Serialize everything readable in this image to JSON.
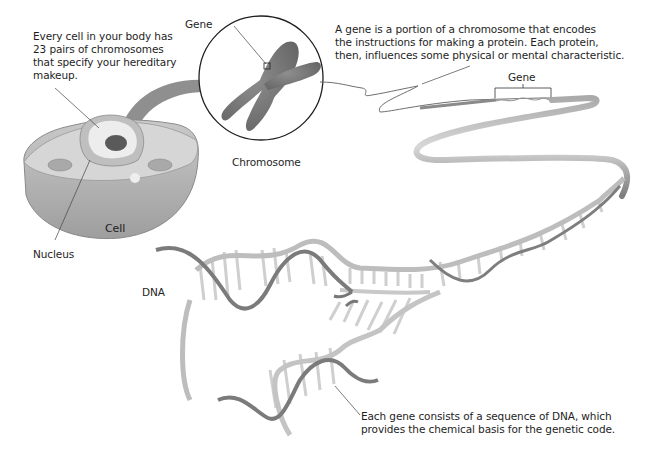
{
  "diagram": {
    "type": "biology-illustration",
    "colors": {
      "background": "#ffffff",
      "text": "#1e1e1e",
      "arrow": "#8a8a8a",
      "chromosome": "#7b7b7b",
      "cell_body": "#b9b9b9",
      "cell_top": "#d4d4d4",
      "nucleus": "#e6e6e6",
      "nucleolus": "#555555",
      "dna_backbone_dark": "#7a7a7a",
      "dna_backbone_light": "#bdbdbd",
      "dna_rungs": "#d0d0d0",
      "leader_line": "#444444"
    }
  },
  "labels": {
    "cell_description": "Every cell in your body has\n23 pairs of chromosomes\nthat specify your hereditary\nmakeup.",
    "gene_top": "Gene",
    "gene_description": "A gene is a portion of a chromosome that encodes\nthe instructions for making a protein. Each protein,\nthen, influences some physical or mental characteristic.",
    "gene_bracket": "Gene",
    "chromosome": "Chromosome",
    "cell": "Cell",
    "nucleus": "Nucleus",
    "dna": "DNA",
    "dna_description": "Each gene consists of a sequence of DNA, which\nprovides the chemical basis for the genetic code."
  }
}
